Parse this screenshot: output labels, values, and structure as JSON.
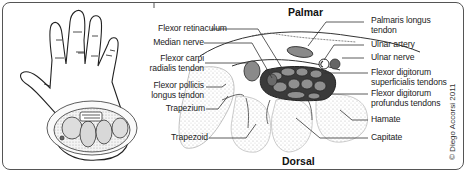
{
  "figure": {
    "orientation_labels": {
      "top": "Palmar",
      "bottom": "Dorsal"
    },
    "left_labels": [
      {
        "text": "Flexor retinaculum"
      },
      {
        "text": "Median nerve"
      },
      {
        "text": "Flexor carpi\nradialis tendon",
        "line1": "Flexor carpi",
        "line2": "radialis tendon"
      },
      {
        "text": "Flexor pollicis\nlongus tendon",
        "line1": "Flexor pollicis",
        "line2": "longus tendon"
      },
      {
        "text": "Trapezium"
      },
      {
        "text": "Trapezoid"
      }
    ],
    "right_labels": [
      {
        "line1": "Palmaris longus",
        "line2": "tendon"
      },
      {
        "line1": "Ulnar artery"
      },
      {
        "line1": "Ulnar nerve"
      },
      {
        "line1": "Flexor digitorum",
        "line2": "superficialis tendons"
      },
      {
        "line1": "Flexor digitorum",
        "line2": "profundus tendons"
      },
      {
        "line1": "Hamate"
      },
      {
        "line1": "Capitate"
      }
    ],
    "copyright": "© Diego Accorsi 2011",
    "colors": {
      "tendon_gray": "#8a8a8a",
      "tunnel_dark": "#3a3a3a",
      "bone_stipple": "#d9d9d9",
      "line": "#333333"
    }
  }
}
